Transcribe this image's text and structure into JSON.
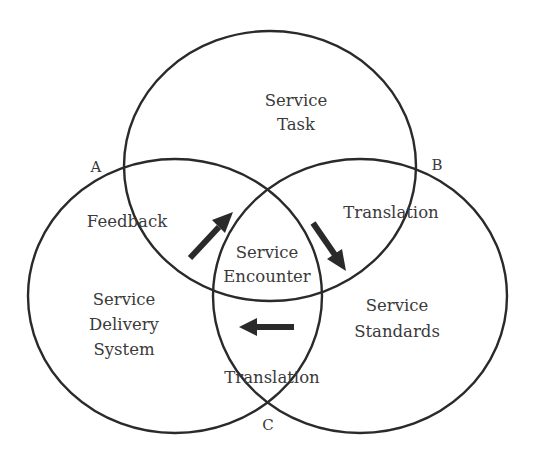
{
  "diagram": {
    "circles": {
      "top": {
        "label_line1": "Service",
        "label_line2": "Task"
      },
      "left": {
        "label_line1": "Service",
        "label_line2": "Delivery",
        "label_line3": "System"
      },
      "right": {
        "label_line1": "Service",
        "label_line2": "Standards"
      }
    },
    "overlaps": {
      "top_left": "Feedback",
      "top_right": "Translation",
      "left_right": "Translation",
      "center_line1": "Service",
      "center_line2": "Encounter"
    },
    "points": {
      "a": "A",
      "b": "B",
      "c": "C"
    },
    "arrows": [
      {
        "name": "feedback-arrow",
        "direction": "up-right"
      },
      {
        "name": "translation-arrow-top",
        "direction": "down-right"
      },
      {
        "name": "translation-arrow-bottom",
        "direction": "left"
      }
    ],
    "colors": {
      "stroke": "#2a2a2a",
      "text": "#3a3a3a",
      "background": "#ffffff"
    }
  }
}
